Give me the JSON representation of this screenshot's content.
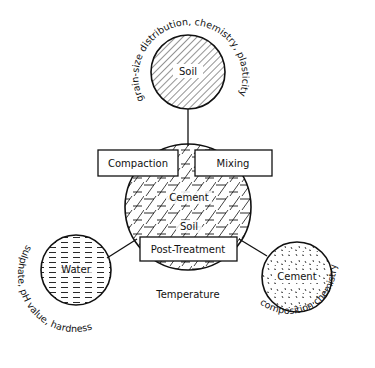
{
  "diagram": {
    "colors": {
      "ink": "#111111",
      "background": "#ffffff"
    },
    "nodes": {
      "soil": {
        "label": "Soil",
        "fill_pattern": "diagonal-hatch",
        "properties": "grain-size distribution, chemistry, plasticity"
      },
      "mixture": {
        "labels": [
          "Cement",
          "Soil"
        ],
        "fill_pattern": "diagonal-and-dash-hatch"
      },
      "water": {
        "label": "Water",
        "fill_pattern": "horizontal-dashes",
        "properties": "sulphate, pH value, hardness"
      },
      "cement": {
        "label": "Cement",
        "fill_pattern": "stipple",
        "properties": "composition chemistry"
      }
    },
    "processes": {
      "compaction": "Compaction",
      "mixing": "Mixing",
      "post_treatment": "Post-Treatment"
    },
    "factors": {
      "temperature": "Temperature"
    }
  }
}
